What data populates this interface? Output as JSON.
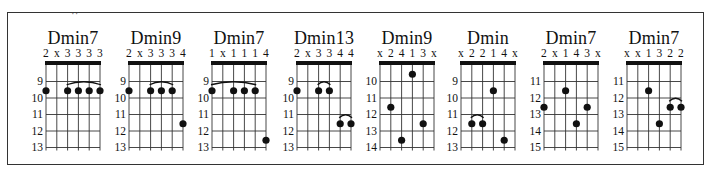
{
  "frame": {
    "cropped_top_text": "··"
  },
  "chart_data": {
    "type": "diagram",
    "strings": 6,
    "chords": [
      {
        "name": "Dmin7",
        "fingering": [
          "2",
          "x",
          "3",
          "3",
          "3",
          "3"
        ],
        "fret_labels": [
          "9",
          "10",
          "11",
          "12",
          "13"
        ],
        "dots": [
          {
            "string": 0,
            "fret": "10"
          },
          {
            "string": 2,
            "fret": "10"
          },
          {
            "string": 3,
            "fret": "10"
          },
          {
            "string": 4,
            "fret": "10"
          },
          {
            "string": 5,
            "fret": "10"
          }
        ],
        "barres": [
          {
            "from": 2,
            "to": 5,
            "fret": "10"
          }
        ]
      },
      {
        "name": "Dmin9",
        "fingering": [
          "2",
          "x",
          "3",
          "3",
          "3",
          "4"
        ],
        "fret_labels": [
          "9",
          "10",
          "11",
          "12",
          "13"
        ],
        "dots": [
          {
            "string": 0,
            "fret": "10"
          },
          {
            "string": 2,
            "fret": "10"
          },
          {
            "string": 3,
            "fret": "10"
          },
          {
            "string": 4,
            "fret": "10"
          },
          {
            "string": 5,
            "fret": "12"
          }
        ],
        "barres": [
          {
            "from": 2,
            "to": 4,
            "fret": "10"
          }
        ]
      },
      {
        "name": "Dmin7",
        "fingering": [
          "1",
          "x",
          "1",
          "1",
          "1",
          "4"
        ],
        "fret_labels": [
          "9",
          "10",
          "11",
          "12",
          "13"
        ],
        "dots": [
          {
            "string": 0,
            "fret": "10"
          },
          {
            "string": 2,
            "fret": "10"
          },
          {
            "string": 3,
            "fret": "10"
          },
          {
            "string": 4,
            "fret": "10"
          },
          {
            "string": 5,
            "fret": "13"
          }
        ],
        "barres": [
          {
            "from": 0,
            "to": 4,
            "fret": "10"
          }
        ]
      },
      {
        "name": "Dmin13",
        "fingering": [
          "2",
          "x",
          "3",
          "3",
          "4",
          "4"
        ],
        "fret_labels": [
          "9",
          "10",
          "11",
          "12",
          "13"
        ],
        "dots": [
          {
            "string": 0,
            "fret": "10"
          },
          {
            "string": 2,
            "fret": "10"
          },
          {
            "string": 3,
            "fret": "10"
          },
          {
            "string": 4,
            "fret": "12"
          },
          {
            "string": 5,
            "fret": "12"
          }
        ],
        "barres": [
          {
            "from": 2,
            "to": 3,
            "fret": "10"
          },
          {
            "from": 4,
            "to": 5,
            "fret": "12"
          }
        ]
      },
      {
        "name": "Dmin9",
        "fingering": [
          "x",
          "2",
          "4",
          "1",
          "3",
          "x"
        ],
        "fret_labels": [
          "10",
          "11",
          "12",
          "13",
          "14"
        ],
        "dots": [
          {
            "string": 1,
            "fret": "12"
          },
          {
            "string": 2,
            "fret": "14"
          },
          {
            "string": 3,
            "fret": "10"
          },
          {
            "string": 4,
            "fret": "13"
          }
        ],
        "barres": []
      },
      {
        "name": "Dmin",
        "fingering": [
          "x",
          "2",
          "2",
          "1",
          "4",
          "x"
        ],
        "fret_labels": [
          "9",
          "10",
          "11",
          "12",
          "13"
        ],
        "dots": [
          {
            "string": 1,
            "fret": "12"
          },
          {
            "string": 2,
            "fret": "12"
          },
          {
            "string": 3,
            "fret": "10"
          },
          {
            "string": 4,
            "fret": "13"
          }
        ],
        "barres": [
          {
            "from": 1,
            "to": 2,
            "fret": "12"
          }
        ]
      },
      {
        "name": "Dmin7",
        "fingering": [
          "2",
          "x",
          "1",
          "4",
          "3",
          "x"
        ],
        "fret_labels": [
          "11",
          "12",
          "13",
          "14",
          "15"
        ],
        "dots": [
          {
            "string": 0,
            "fret": "13"
          },
          {
            "string": 2,
            "fret": "12"
          },
          {
            "string": 3,
            "fret": "14"
          },
          {
            "string": 4,
            "fret": "13"
          }
        ],
        "barres": []
      },
      {
        "name": "Dmin7",
        "fingering": [
          "x",
          "x",
          "1",
          "3",
          "2",
          "2"
        ],
        "fret_labels": [
          "11",
          "12",
          "13",
          "14",
          "15"
        ],
        "dots": [
          {
            "string": 2,
            "fret": "12"
          },
          {
            "string": 3,
            "fret": "14"
          },
          {
            "string": 4,
            "fret": "13"
          },
          {
            "string": 5,
            "fret": "13"
          }
        ],
        "barres": [
          {
            "from": 4,
            "to": 5,
            "fret": "13"
          }
        ]
      }
    ]
  },
  "layout": {
    "chord_left_px": [
      46,
      129,
      212,
      297,
      380,
      461,
      544,
      627
    ]
  }
}
